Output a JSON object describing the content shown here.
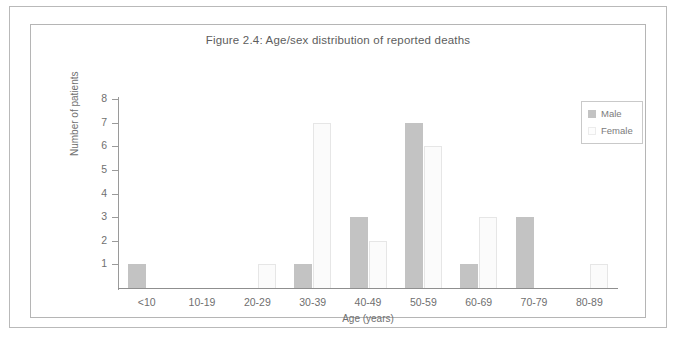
{
  "figure": {
    "title": "Figure 2.4: Age/sex distribution of reported deaths"
  },
  "legend": {
    "male_label": "Male",
    "female_label": "Female",
    "male_color": "#c3c3c3",
    "female_color": "#fbfbfb"
  },
  "chart_data": {
    "type": "bar",
    "title": "Figure 2.4: Age/sex distribution of reported deaths",
    "xlabel": "Age (years)",
    "ylabel": "Number of patients",
    "categories": [
      "<10",
      "10-19",
      "20-29",
      "30-39",
      "40-49",
      "50-59",
      "60-69",
      "70-79",
      "80-89"
    ],
    "series": [
      {
        "name": "Male",
        "color": "#c3c3c3",
        "values": [
          1,
          0,
          0,
          1,
          3,
          7,
          1,
          3,
          0
        ]
      },
      {
        "name": "Female",
        "color": "#fbfbfb",
        "values": [
          0,
          0,
          1,
          7,
          2,
          6,
          3,
          0,
          1
        ]
      }
    ],
    "ylim": [
      0,
      8
    ],
    "yticks": [
      1,
      2,
      3,
      4,
      5,
      6,
      7,
      8
    ],
    "grid": false,
    "legend_position": "top-right"
  }
}
